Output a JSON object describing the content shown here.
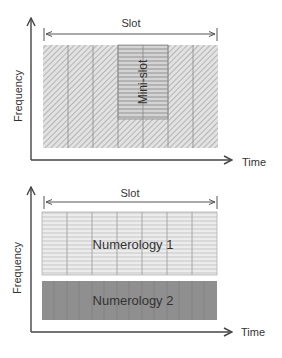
{
  "top_diagram": {
    "y_axis_label": "Frequency",
    "x_axis_label": "Time",
    "slot_label": "Slot",
    "mini_slot_label": "Mini-slot",
    "columns": 7,
    "mini_slot_columns": [
      4,
      5
    ]
  },
  "bottom_diagram": {
    "y_axis_label": "Frequency",
    "x_axis_label": "Time",
    "slot_label": "Slot",
    "numerology_1_label": "Numerology 1",
    "numerology_2_label": "Numerology 2",
    "numerology_1_columns": 7
  },
  "colors": {
    "axis": "#444444",
    "hatch_fill": "#e4e4e4",
    "hatch_line": "#9a9a9a",
    "numerology_1_fill": "#e8e8e8",
    "numerology_2_fill": "#8e8e8e"
  }
}
